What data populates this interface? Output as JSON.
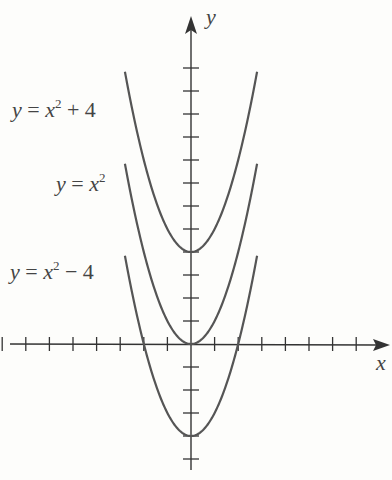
{
  "chart_data": {
    "type": "line",
    "title": "",
    "xlabel": "x",
    "ylabel": "y",
    "xlim": [
      -8,
      7
    ],
    "ylim": [
      -6,
      12
    ],
    "tick_spacing": 1,
    "grid": false,
    "legend": "inline labels at left",
    "series": [
      {
        "name": "y = x^2 + 4",
        "label_parts": [
          "y",
          " = ",
          "x",
          "2",
          " + 4"
        ],
        "formula": "x*x+4",
        "x_range": [
          -2.8,
          2.8
        ]
      },
      {
        "name": "y = x^2",
        "label_parts": [
          "y",
          " = ",
          "x",
          "2",
          ""
        ],
        "formula": "x*x",
        "x_range": [
          -2.8,
          2.8
        ]
      },
      {
        "name": "y = x^2 - 4",
        "label_parts": [
          "y",
          " = ",
          "x",
          "2",
          " − 4"
        ],
        "formula": "x*x-4",
        "x_range": [
          -2.8,
          2.8
        ]
      }
    ],
    "colors": {
      "axis": "#333333",
      "curve": "#555555"
    }
  }
}
